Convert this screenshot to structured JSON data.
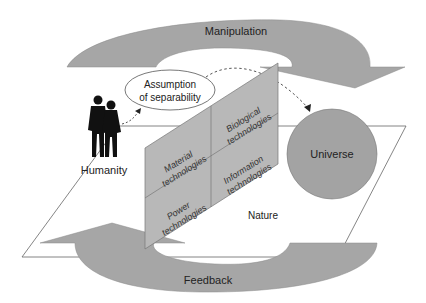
{
  "diagram": {
    "arrows": {
      "top": {
        "label": "Manipulation"
      },
      "bottom": {
        "label": "Feedback"
      }
    },
    "actors": {
      "humanity": {
        "label": "Humanity",
        "icon": "people-silhouette-icon"
      },
      "universe": {
        "label": "Universe"
      },
      "nature": {
        "label": "Nature"
      }
    },
    "assumption": {
      "line1": "Assumption",
      "line2": "of separability"
    },
    "technologies": [
      {
        "line1": "Material",
        "line2": "technologies"
      },
      {
        "line1": "Biological",
        "line2": "technologies"
      },
      {
        "line1": "Power",
        "line2": "technologies"
      },
      {
        "line1": "Information",
        "line2": "technologies"
      }
    ],
    "colors": {
      "arrow_fill": "#a6a6a6",
      "panel_fill": "#b8b8b8",
      "circle_fill": "#a3a3a3",
      "line": "#555555"
    }
  }
}
